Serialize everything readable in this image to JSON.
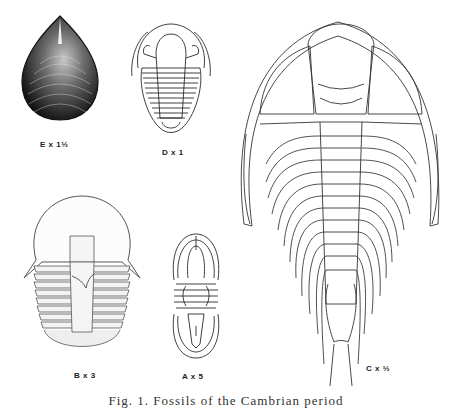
{
  "figure": {
    "caption": "Fig. 1. Fossils of the Cambrian period",
    "specimens": [
      {
        "id": "E",
        "label": "E x 1½",
        "kind": "brachiopod-shell"
      },
      {
        "id": "D",
        "label": "D x 1",
        "kind": "trilobite"
      },
      {
        "id": "B",
        "label": "B x 3",
        "kind": "trilobite"
      },
      {
        "id": "A",
        "label": "A x 5",
        "kind": "trilobite"
      },
      {
        "id": "C",
        "label": "C x ⅓",
        "kind": "trilobite"
      }
    ]
  },
  "colors": {
    "ink": "#2a2a2a",
    "paper": "#ffffff"
  }
}
